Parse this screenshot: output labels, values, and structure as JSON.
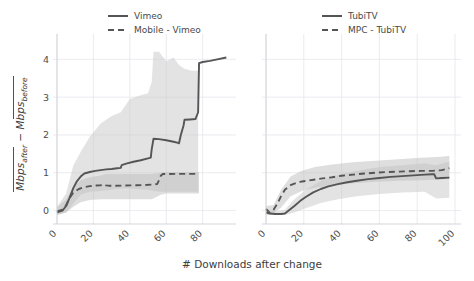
{
  "figure": {
    "xlabel": "# Downloads after change",
    "ylabel_parts": {
      "first": "Mbps",
      "first_sub": "after",
      "minus": "−",
      "second": "Mbps",
      "second_sub": "before"
    }
  },
  "chart_data": [
    {
      "type": "line",
      "panel": "left",
      "title": "",
      "xlabel": "# Downloads after change",
      "ylabel": "Mbps_after_bar - Mbps_before_bar",
      "xlim": [
        0,
        95
      ],
      "ylim": [
        -0.25,
        4.3
      ],
      "xticks": [
        0,
        20,
        40,
        60,
        80
      ],
      "yticks": [
        0,
        1,
        2,
        3,
        4
      ],
      "grid": true,
      "legend_position": "top-center",
      "series": [
        {
          "name": "Vimeo",
          "style": "solid",
          "color": "#555555",
          "x": [
            0,
            3,
            5,
            7,
            9,
            11,
            13,
            15,
            18,
            21,
            24,
            27,
            30,
            33,
            35,
            35.5,
            38,
            42,
            46,
            50,
            51.5,
            52,
            53,
            56,
            60,
            64,
            66.5,
            67,
            68,
            69.5,
            70,
            73,
            76,
            77.5,
            78,
            80,
            84,
            88,
            93
          ],
          "y": [
            -0.05,
            0.0,
            0.12,
            0.35,
            0.6,
            0.78,
            0.9,
            0.98,
            1.02,
            1.05,
            1.07,
            1.09,
            1.1,
            1.12,
            1.13,
            1.2,
            1.24,
            1.29,
            1.33,
            1.38,
            1.4,
            1.62,
            1.9,
            1.89,
            1.86,
            1.82,
            1.79,
            1.78,
            2.0,
            2.25,
            2.4,
            2.41,
            2.42,
            2.6,
            3.9,
            3.93,
            3.96,
            4.0,
            4.05
          ]
        },
        {
          "name": "Mobile - Vimeo",
          "style": "dashed",
          "color": "#555555",
          "x": [
            0,
            3,
            5,
            7,
            9,
            12,
            15,
            18,
            21,
            24,
            26,
            27,
            29,
            32,
            36,
            40,
            44,
            48,
            52,
            55,
            56,
            57,
            58,
            62,
            66,
            70,
            74,
            78
          ],
          "y": [
            -0.02,
            0.02,
            0.14,
            0.34,
            0.48,
            0.57,
            0.62,
            0.645,
            0.66,
            0.67,
            0.69,
            0.665,
            0.655,
            0.655,
            0.66,
            0.665,
            0.67,
            0.675,
            0.685,
            0.7,
            0.8,
            0.92,
            0.965,
            0.968,
            0.97,
            0.97,
            0.97,
            0.97
          ]
        }
      ],
      "bands": [
        {
          "for": "Vimeo",
          "x": [
            0,
            5,
            9,
            13,
            18,
            24,
            30,
            35,
            40,
            46,
            50,
            52,
            53,
            56,
            60,
            64,
            67,
            70,
            74,
            77.5
          ],
          "lower": [
            -0.12,
            -0.05,
            0.18,
            0.42,
            0.5,
            0.52,
            0.55,
            0.58,
            0.58,
            0.56,
            0.55,
            0.53,
            0.52,
            0.5,
            0.5,
            0.5,
            0.5,
            0.5,
            0.5,
            0.5
          ],
          "upper": [
            0.1,
            0.45,
            1.2,
            1.55,
            1.95,
            2.3,
            2.5,
            2.6,
            2.95,
            3.05,
            3.1,
            3.4,
            4.2,
            4.2,
            3.95,
            4.05,
            3.85,
            3.75,
            3.7,
            3.7
          ]
        },
        {
          "for": "Mobile - Vimeo",
          "x": [
            0,
            5,
            9,
            13,
            18,
            24,
            27,
            30,
            36,
            44,
            52,
            57,
            60,
            66,
            72,
            78
          ],
          "lower": [
            -0.12,
            -0.05,
            0.1,
            0.22,
            0.28,
            0.3,
            0.3,
            0.3,
            0.3,
            0.3,
            0.3,
            0.42,
            0.45,
            0.45,
            0.45,
            0.45
          ],
          "upper": [
            0.08,
            0.3,
            0.62,
            0.8,
            0.88,
            0.93,
            0.97,
            0.97,
            0.97,
            0.97,
            0.97,
            1.0,
            1.02,
            1.02,
            1.02,
            1.02
          ]
        }
      ]
    },
    {
      "type": "line",
      "panel": "right",
      "title": "",
      "xlabel": "# Downloads after change",
      "ylabel": "Mbps_after_bar - Mbps_before_bar",
      "xlim": [
        0,
        100
      ],
      "ylim": [
        -0.25,
        4.3
      ],
      "xticks": [
        0,
        20,
        40,
        60,
        80,
        100
      ],
      "yticks": [
        0,
        1,
        2,
        3,
        4
      ],
      "grid": true,
      "legend_position": "top-center",
      "series": [
        {
          "name": "TubiTV",
          "style": "solid",
          "color": "#555555",
          "x": [
            0,
            2,
            5,
            8,
            10,
            12,
            15,
            18,
            21,
            25,
            29,
            33,
            38,
            43,
            48,
            54,
            60,
            66,
            72,
            78,
            84,
            88,
            89,
            90,
            93,
            97
          ],
          "y": [
            -0.05,
            -0.08,
            -0.09,
            -0.09,
            -0.08,
            0.0,
            0.12,
            0.25,
            0.36,
            0.48,
            0.57,
            0.64,
            0.7,
            0.75,
            0.79,
            0.83,
            0.86,
            0.89,
            0.91,
            0.93,
            0.95,
            0.96,
            0.96,
            0.85,
            0.86,
            0.87
          ]
        },
        {
          "name": "MPC - TubiTV",
          "style": "dashed",
          "color": "#555555",
          "x": [
            0,
            2,
            4,
            6,
            8,
            10,
            13,
            16,
            19,
            22,
            26,
            30,
            35,
            40,
            46,
            52,
            58,
            64,
            70,
            76,
            82,
            88,
            93,
            97
          ],
          "y": [
            0.04,
            -0.06,
            0.02,
            0.18,
            0.38,
            0.55,
            0.67,
            0.73,
            0.77,
            0.79,
            0.82,
            0.85,
            0.88,
            0.92,
            0.95,
            0.98,
            1.0,
            1.02,
            1.03,
            1.04,
            1.05,
            1.05,
            1.07,
            1.12
          ]
        }
      ],
      "bands": [
        {
          "for": "TubiTV",
          "x": [
            0,
            5,
            10,
            15,
            21,
            29,
            38,
            48,
            60,
            72,
            84,
            90,
            97
          ],
          "lower": [
            -0.12,
            -0.12,
            -0.12,
            -0.05,
            0.06,
            0.2,
            0.3,
            0.38,
            0.44,
            0.48,
            0.5,
            0.32,
            0.34
          ],
          "upper": [
            0.05,
            -0.02,
            0.02,
            0.3,
            0.55,
            0.78,
            0.95,
            1.05,
            1.15,
            1.2,
            1.25,
            1.2,
            1.3
          ]
        },
        {
          "for": "MPC - TubiTV",
          "x": [
            0,
            4,
            8,
            13,
            19,
            26,
            35,
            46,
            58,
            70,
            82,
            93,
            97
          ],
          "lower": [
            -0.1,
            -0.08,
            0.08,
            0.38,
            0.52,
            0.6,
            0.66,
            0.72,
            0.76,
            0.79,
            0.8,
            0.82,
            0.84
          ],
          "upper": [
            0.12,
            0.15,
            0.55,
            0.9,
            1.05,
            1.15,
            1.22,
            1.28,
            1.32,
            1.36,
            1.4,
            1.42,
            1.45
          ]
        }
      ]
    }
  ],
  "left_panel": {
    "legend": [
      {
        "label": "Vimeo",
        "style": "solid"
      },
      {
        "label": "Mobile - Vimeo",
        "style": "dashed"
      }
    ],
    "xticklabels": [
      "0",
      "20",
      "40",
      "60",
      "80"
    ],
    "yticklabels": [
      "0",
      "1",
      "2",
      "3",
      "4"
    ]
  },
  "right_panel": {
    "legend": [
      {
        "label": "TubiTV",
        "style": "solid"
      },
      {
        "label": "MPC - TubiTV",
        "style": "dashed"
      }
    ],
    "xticklabels": [
      "0",
      "20",
      "40",
      "60",
      "80",
      "100"
    ],
    "yticklabels": [
      "0",
      "1",
      "2",
      "3",
      "4"
    ]
  },
  "colors": {
    "line": "#555555",
    "band": "#cccccc",
    "grid": "#e6e6ec",
    "text": "#4d4d4d"
  }
}
